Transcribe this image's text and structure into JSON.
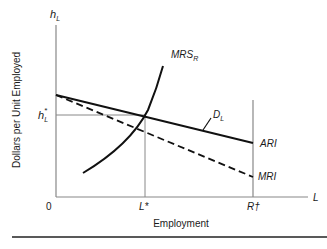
{
  "diagram": {
    "y_axis_label": "Dollars per Unit Employed",
    "x_axis_label": "Employment",
    "y_axis_symbol": "h",
    "y_axis_symbol_sub": "L",
    "x_axis_symbol": "L",
    "origin_label": "0",
    "h_star": {
      "base": "h",
      "sub": "L",
      "sup": "*"
    },
    "l_star": "L*",
    "r_dagger": "R†",
    "curves": {
      "mrs": {
        "base": "MRS",
        "sub": "R"
      },
      "demand": {
        "base": "D",
        "sub": "L"
      },
      "ari": "ARI",
      "mri": "MRI"
    }
  }
}
